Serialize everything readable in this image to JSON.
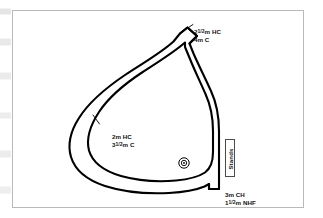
{
  "figure": {
    "kind": "racecourse-plan-diagram",
    "frame_border_color": "#b9b9bd",
    "background_color": "#ffffff",
    "track_line_color": "#000000"
  },
  "labels": {
    "top_chute": {
      "line1_prefix": "2",
      "line1_fraction": "1/2",
      "line1_suffix": "m HC",
      "line2": "4m C",
      "full_text": "2½m HC / 4m C"
    },
    "left_side": {
      "line1": "2m HC",
      "line2_prefix": "3",
      "line2_fraction": "1/2",
      "line2_suffix": "m C",
      "full_text": "2m HC / 3½m C"
    },
    "bottom_chute": {
      "line1": "3m CH",
      "line2_prefix": "1",
      "line2_fraction": "1/2",
      "line2_suffix": "m NHF",
      "full_text": "3m CH / 1½m NHF"
    },
    "stands": "Stands"
  },
  "markers": {
    "winning_post": "winning-post-marker"
  }
}
